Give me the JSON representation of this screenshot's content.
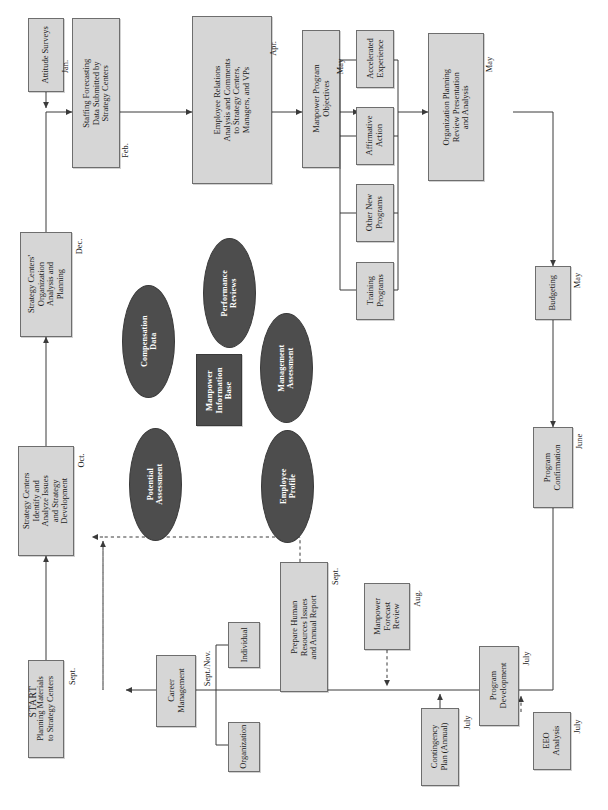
{
  "diagram": {
    "orientation": "rotated-90-ccw",
    "start_label": "START",
    "colors": {
      "box_fill": "#d6d6d6",
      "box_stroke": "#6e6e6e",
      "dark_fill": "#4d4d4d",
      "dark_text": "#ffffff",
      "line": "#3a3a3a",
      "page": "#ffffff"
    }
  },
  "nodes": [
    {
      "id": "attitude_surveys",
      "label": "Attitude Surveys"
    },
    {
      "id": "staffing_forecast",
      "label": "Staffing Forecasting\nData Submitted by\nStrategy Centers"
    },
    {
      "id": "employee_relations",
      "label": "Employee Relations\nAnalysis and Comments\nto Strategy Centers,\nManagers, and VPs"
    },
    {
      "id": "manpower_objectives",
      "label": "Manpower Program\nObjectives"
    },
    {
      "id": "training_programs",
      "label": "Training\nPrograms"
    },
    {
      "id": "other_new_programs",
      "label": "Other New\nPrograms"
    },
    {
      "id": "affirmative_action",
      "label": "Affirmative\nAction"
    },
    {
      "id": "accelerated_exp",
      "label": "Accelerated\nExperience"
    },
    {
      "id": "org_planning_review",
      "label": "Organization Planning\nReview Presentation\nand Analysis"
    },
    {
      "id": "budgeting",
      "label": "Budgeting"
    },
    {
      "id": "program_confirm",
      "label": "Program\nConfirmation"
    },
    {
      "id": "program_dev",
      "label": "Program\nDevelopment"
    },
    {
      "id": "eeo_analysis",
      "label": "EEO\nAnalysis"
    },
    {
      "id": "contingency_plan",
      "label": "Contingency\nPlan (Annual)"
    },
    {
      "id": "manpower_forecast",
      "label": "Manpower\nForecast\nReview"
    },
    {
      "id": "prepare_hr",
      "label": "Prepare Human\nResources Issues\nand Annual Report"
    },
    {
      "id": "individual",
      "label": "Individual"
    },
    {
      "id": "organization",
      "label": "Organization"
    },
    {
      "id": "career_mgmt",
      "label": "Career\nManagement"
    },
    {
      "id": "planning_materials",
      "label": "Planning Materials\nto Strategy Centers"
    },
    {
      "id": "sc_identify",
      "label": "Strategy Centers\nIdentify and\nAnalyze Issues\nand Strategy\nDevelopment"
    },
    {
      "id": "sc_org_analysis",
      "label": "Strategy Centers'\nOrganization\nAnalysis and\nPlanning"
    },
    {
      "id": "manpower_info_base",
      "label": "Manpower\nInformation\nBase"
    }
  ],
  "data_stores": [
    {
      "id": "compensation_data",
      "label": "Compensation\nData"
    },
    {
      "id": "performance_reviews",
      "label": "Performance\nReviews"
    },
    {
      "id": "mgmt_assessment",
      "label": "Management\nAssessment"
    },
    {
      "id": "potential_assessment",
      "label": "Potential\nAssessment"
    },
    {
      "id": "employee_profile",
      "label": "Employee\nProfile"
    }
  ],
  "month_labels": [
    {
      "id": "m_jan",
      "text": "Jan."
    },
    {
      "id": "m_feb",
      "text": "Feb."
    },
    {
      "id": "m_apr",
      "text": "Apr."
    },
    {
      "id": "m_may_obj",
      "text": "May"
    },
    {
      "id": "m_may_opr",
      "text": "May"
    },
    {
      "id": "m_may_bud",
      "text": "May"
    },
    {
      "id": "m_june",
      "text": "June"
    },
    {
      "id": "m_july_pd",
      "text": "July"
    },
    {
      "id": "m_july_eeo",
      "text": "July"
    },
    {
      "id": "m_july_cp",
      "text": "July"
    },
    {
      "id": "m_aug",
      "text": "Aug."
    },
    {
      "id": "m_sept_hr",
      "text": "Sept."
    },
    {
      "id": "m_sept_nov",
      "text": "Sept./Nov."
    },
    {
      "id": "m_sept_pm",
      "text": "Sept."
    },
    {
      "id": "m_oct",
      "text": "Oct."
    },
    {
      "id": "m_dec",
      "text": "Dec."
    }
  ]
}
